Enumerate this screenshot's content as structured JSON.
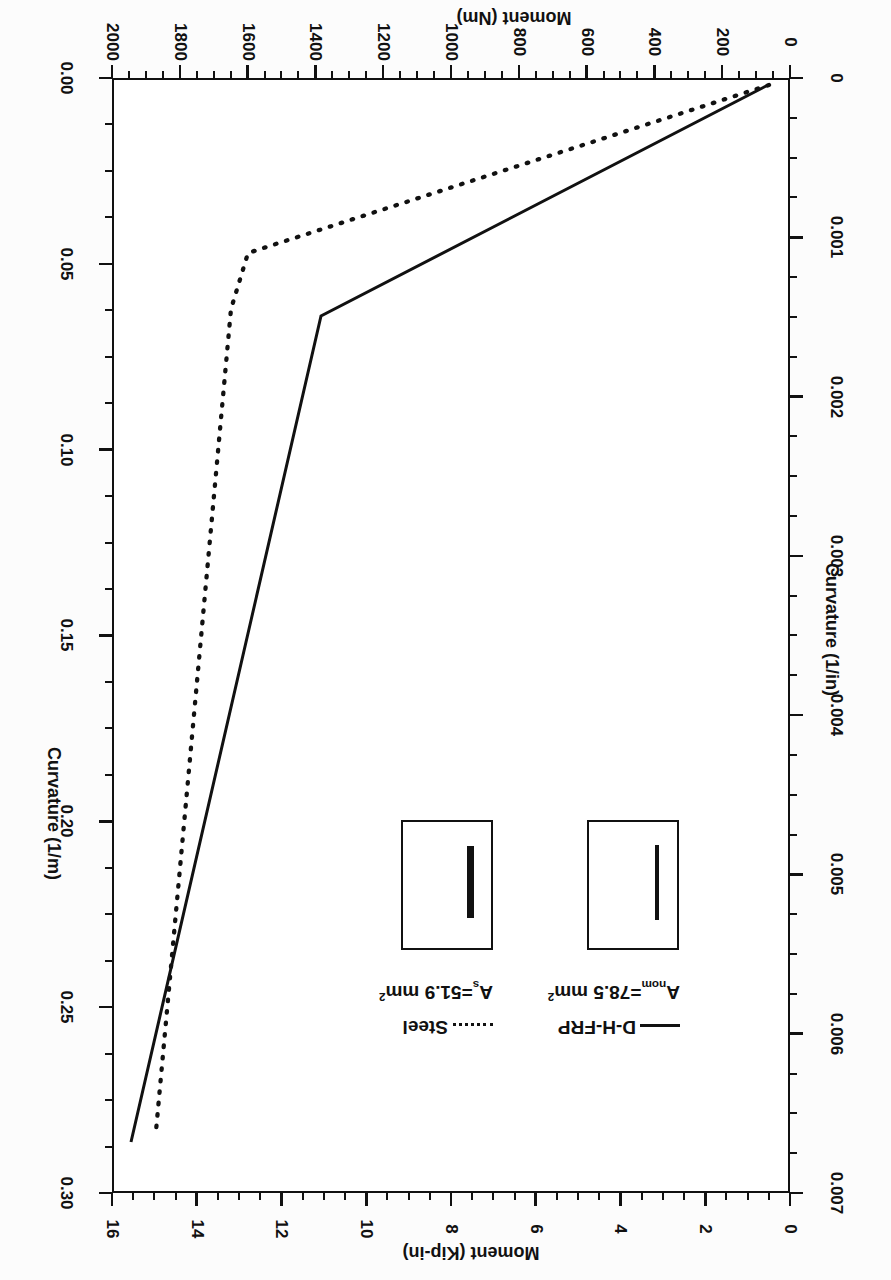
{
  "figure": {
    "rotation_deg": 180,
    "background": "#fcfcfc",
    "ink": "#111111"
  },
  "axes": {
    "bottom": {
      "title": "Moment (Nm)",
      "ticks": [
        "0",
        "200",
        "400",
        "600",
        "800",
        "1000",
        "1200",
        "1400",
        "1600",
        "1800",
        "2000"
      ],
      "range": [
        0,
        2000
      ],
      "minor_per_major": 4
    },
    "top": {
      "title": "Moment (Kip-in)",
      "ticks": [
        "0",
        "2",
        "4",
        "6",
        "8",
        "10",
        "12",
        "14",
        "16"
      ],
      "range": [
        0,
        17.7
      ],
      "minor_per_major": 4
    },
    "left": {
      "title": "Curvature (1/in)",
      "ticks": [
        "0",
        "0.001",
        "0.002",
        "0.003",
        "0.004",
        "0.005",
        "0.006",
        "0.007"
      ],
      "range": [
        0,
        0.00762
      ],
      "minor_per_major": 4
    },
    "right": {
      "title": "Curvature (1/m)",
      "ticks": [
        "0.00",
        "0.05",
        "0.10",
        "0.15",
        "0.20",
        "0.25",
        "0.30"
      ],
      "range": [
        0,
        0.3
      ],
      "minor_per_major": 4
    }
  },
  "legend": {
    "entries": [
      {
        "label": "D-H-FRP",
        "sub_prefix": "A",
        "sub_script": "nom",
        "sub_value": "=78.5 mm",
        "sub_sup": "2",
        "style": "solid"
      },
      {
        "label": "Steel",
        "sub_prefix": "A",
        "sub_script": "s",
        "sub_value": "=51.9 mm",
        "sub_sup": "2",
        "style": "dotted"
      }
    ]
  },
  "chart_data": {
    "type": "line",
    "title": "",
    "xlabel": "Moment (Nm)",
    "ylabel": "Curvature (1/m)",
    "xlabel_secondary": "Moment (Kip-in)",
    "ylabel_secondary": "Curvature (1/in)",
    "xlim": [
      0,
      2000
    ],
    "ylim": [
      0,
      0.3
    ],
    "xlim_secondary": [
      0,
      17.7
    ],
    "ylim_secondary": [
      0,
      0.00762
    ],
    "grid": false,
    "legend_position": "upper-left-inside",
    "series": [
      {
        "name": "D-H-FRP",
        "style": "solid",
        "annotation": "A_nom=78.5 mm^2",
        "points": [
          {
            "moment_Nm": 65,
            "curvature_1perm": 0.002
          },
          {
            "moment_Nm": 1385,
            "curvature_1perm": 0.064
          },
          {
            "moment_Nm": 1945,
            "curvature_1perm": 0.285
          }
        ]
      },
      {
        "name": "Steel",
        "style": "dotted",
        "annotation": "A_s=51.9 mm^2",
        "points": [
          {
            "moment_Nm": 62,
            "curvature_1perm": 0.002
          },
          {
            "moment_Nm": 1600,
            "curvature_1perm": 0.047
          },
          {
            "moment_Nm": 1650,
            "curvature_1perm": 0.062
          },
          {
            "moment_Nm": 1872,
            "curvature_1perm": 0.282
          }
        ]
      }
    ]
  }
}
